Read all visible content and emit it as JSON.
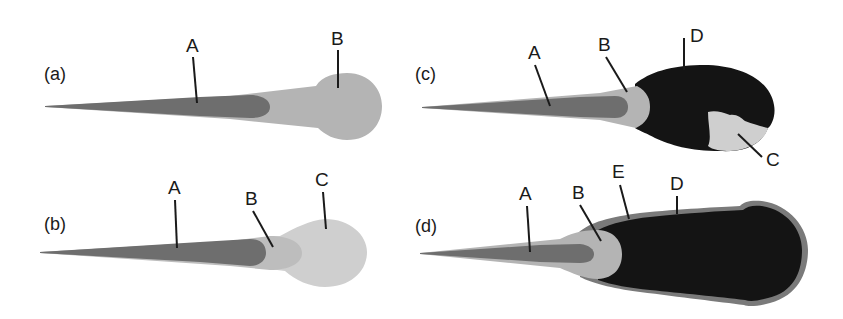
{
  "figure": {
    "colors": {
      "A": "#6e6e6e",
      "B": "#b4b4b4",
      "C": "#cfcfcf",
      "B_mid": "#bdbdbd",
      "D": "#141414",
      "E": "#7a7a7a",
      "line": "#1a1a1a"
    },
    "panels": [
      {
        "id": "a",
        "label": "(a)",
        "regions": [
          "A",
          "B"
        ]
      },
      {
        "id": "b",
        "label": "(b)",
        "regions": [
          "A",
          "B",
          "C"
        ]
      },
      {
        "id": "c",
        "label": "(c)",
        "regions": [
          "A",
          "B",
          "D",
          "C"
        ]
      },
      {
        "id": "d",
        "label": "(d)",
        "regions": [
          "A",
          "B",
          "E",
          "D"
        ]
      }
    ]
  },
  "labels": {
    "a": {
      "panel": "(a)",
      "A": "A",
      "B": "B"
    },
    "b": {
      "panel": "(b)",
      "A": "A",
      "B": "B",
      "C": "C"
    },
    "c": {
      "panel": "(c)",
      "A": "A",
      "B": "B",
      "C": "C",
      "D": "D"
    },
    "d": {
      "panel": "(d)",
      "A": "A",
      "B": "B",
      "D": "D",
      "E": "E"
    }
  }
}
